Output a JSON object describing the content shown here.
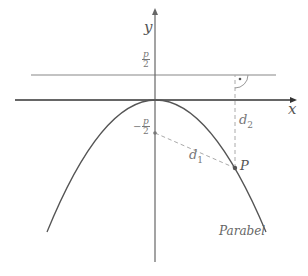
{
  "diagram": {
    "axes": {
      "x_label": "x",
      "y_label": "y"
    },
    "labels": {
      "directrix_value_num": "p",
      "directrix_value_den": "2",
      "focus_value_sign": "−",
      "focus_value_num": "p",
      "focus_value_den": "2",
      "distance_focus": "d",
      "distance_focus_sub": "1",
      "distance_directrix": "d",
      "distance_directrix_sub": "2",
      "point": "P",
      "curve": "Parabel"
    },
    "colors": {
      "axes": "#333333",
      "directrix": "#888888",
      "curve": "#555555",
      "dashed": "#aaaaaa",
      "text": "#555555"
    }
  }
}
